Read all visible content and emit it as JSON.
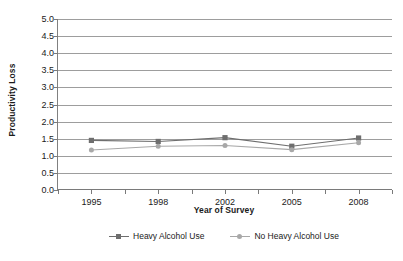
{
  "chart_data": {
    "type": "line",
    "title": "",
    "xlabel": "Year of Survey",
    "ylabel": "Productivity Loss",
    "categories": [
      "1995",
      "1998",
      "2002",
      "2005",
      "2008"
    ],
    "ylim": [
      0.0,
      5.0
    ],
    "ytick_step": 0.5,
    "yticks": [
      "0.0",
      "0.5",
      "1.0",
      "1.5",
      "2.0",
      "2.5",
      "3.0",
      "3.5",
      "4.0",
      "4.5",
      "5.0"
    ],
    "grid": "horizontal",
    "legend_position": "bottom-center",
    "series": [
      {
        "name": "Heavy Alcohol Use",
        "marker": "square",
        "color": "#6e6e6e",
        "values": [
          1.45,
          1.42,
          1.53,
          1.28,
          1.52
        ]
      },
      {
        "name": "No Heavy Alcohol Use",
        "marker": "diamond",
        "color": "#a8a8a8",
        "values": [
          1.17,
          1.28,
          1.3,
          1.18,
          1.38
        ]
      }
    ]
  },
  "axes": {
    "y_title": "Productivity Loss",
    "x_title": "Year of Survey"
  },
  "colors": {
    "gridline": "#9d9d9d",
    "axis": "#7a7a7a",
    "series_heavy": "#6e6e6e",
    "series_no_heavy": "#a8a8a8",
    "text": "#1a1a1a",
    "background": "#ffffff"
  }
}
